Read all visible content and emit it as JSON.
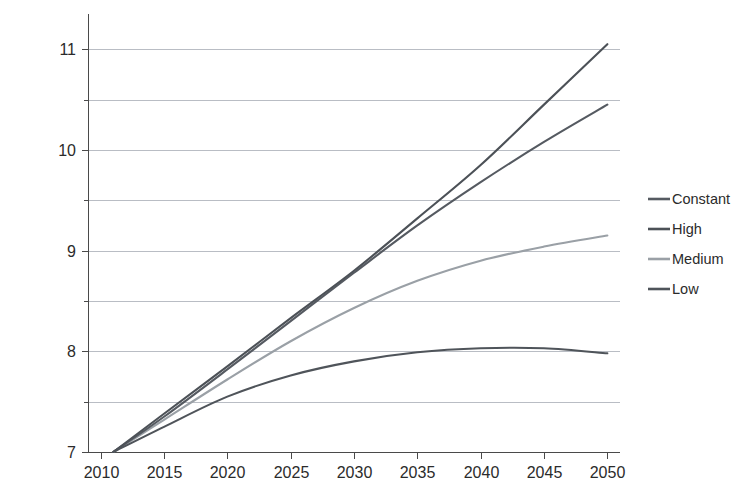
{
  "chart_data": {
    "type": "line",
    "title": "",
    "subtitle": "",
    "xlabel": "",
    "ylabel": "Billion",
    "xlim": [
      2009,
      2051
    ],
    "ylim": [
      7,
      11.35
    ],
    "grid": true,
    "grid_axis": "y",
    "grid_step": 0.5,
    "legend_position": "right",
    "x_ticks": [
      2010,
      2015,
      2020,
      2025,
      2030,
      2035,
      2040,
      2045,
      2050
    ],
    "x_tick_labels": [
      "2010",
      "2015",
      "2020",
      "2025",
      "2030",
      "2035",
      "2040",
      "2045",
      "2050"
    ],
    "y_ticks": [
      7,
      8,
      9,
      10,
      11
    ],
    "y_tick_labels": [
      "7",
      "8",
      "9",
      "10",
      "11"
    ],
    "y_gridlines": [
      7.0,
      7.5,
      8.0,
      8.5,
      9.0,
      9.5,
      10.0,
      10.5,
      11.0
    ],
    "x": [
      2011,
      2015,
      2020,
      2025,
      2030,
      2035,
      2040,
      2045,
      2050
    ],
    "series": [
      {
        "name": "Constant",
        "color": "#555a61",
        "values": [
          7.0,
          7.35,
          7.82,
          8.3,
          8.78,
          9.25,
          9.68,
          10.08,
          10.45
        ]
      },
      {
        "name": "High",
        "color": "#4c5157",
        "values": [
          7.0,
          7.38,
          7.85,
          8.33,
          8.8,
          9.32,
          9.85,
          10.45,
          11.05
        ]
      },
      {
        "name": "Medium",
        "color": "#9aa0a6",
        "values": [
          7.0,
          7.32,
          7.72,
          8.1,
          8.43,
          8.7,
          8.9,
          9.04,
          9.15
        ]
      },
      {
        "name": "Low",
        "color": "#4f545a",
        "values": [
          7.0,
          7.25,
          7.55,
          7.76,
          7.9,
          7.99,
          8.03,
          8.03,
          7.98
        ]
      }
    ]
  },
  "legend": {
    "items": [
      {
        "label": "Constant"
      },
      {
        "label": "High"
      },
      {
        "label": "Medium"
      },
      {
        "label": "Low"
      }
    ]
  },
  "axes": {
    "y_axis_title": "Billion"
  },
  "colors": {
    "gridline": "#b9bdc4",
    "axis": "#4a4a4a",
    "text": "#2b2b2b",
    "background": "#ffffff"
  }
}
